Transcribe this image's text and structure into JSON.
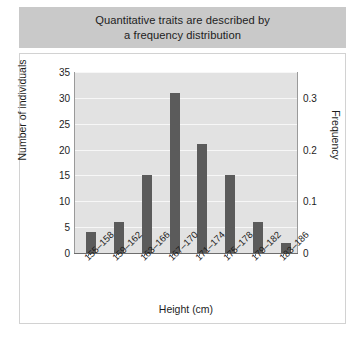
{
  "title": {
    "line1": "Quantitative traits are described by",
    "line2": "a frequency distribution"
  },
  "colors": {
    "title_band": "#c9c9c9",
    "plot_background": "#e2e2e2",
    "gridline": "#f7f7f7",
    "bar": "#5b5b5b",
    "panel_border": "#d2d2d2",
    "text": "#1d1d1d"
  },
  "chart_data": {
    "type": "bar",
    "title": "Quantitative traits are described by a frequency distribution",
    "xlabel": "Height (cm)",
    "ylabel": "Number of individuals",
    "y2label": "Frequency",
    "categories": [
      "155–158",
      "159–162",
      "163–166",
      "167–170",
      "171–174",
      "175–178",
      "179–182",
      "183–186"
    ],
    "values": [
      4,
      6,
      15,
      31,
      21,
      15,
      6,
      2
    ],
    "ylim": [
      0,
      35
    ],
    "yticks": [
      0,
      5,
      10,
      15,
      20,
      25,
      30,
      35
    ],
    "ytick_labels": [
      "0",
      "5",
      "10",
      "15",
      "20",
      "25",
      "30",
      "35"
    ],
    "y2lim": [
      0,
      0.35
    ],
    "y2ticks": [
      0,
      0.1,
      0.2,
      0.3
    ],
    "y2tick_labels": [
      "0",
      "0.1",
      "0.2",
      "0.3"
    ],
    "grid": true,
    "legend": null,
    "frequencies": [
      0.04,
      0.06,
      0.15,
      0.31,
      0.21,
      0.15,
      0.06,
      0.02
    ]
  }
}
